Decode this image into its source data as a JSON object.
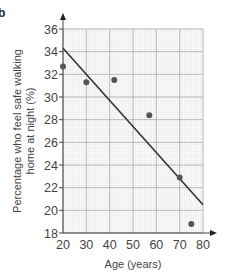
{
  "part_label": "b",
  "chart_data": {
    "type": "scatter",
    "title": "",
    "xlabel": "Age (years)",
    "ylabel_line1": "Percentage who feel safe walking",
    "ylabel_line2": "home at night (%)",
    "xlim": [
      20,
      80
    ],
    "ylim": [
      18,
      36
    ],
    "x_ticks": [
      20,
      30,
      40,
      50,
      60,
      70,
      80
    ],
    "y_ticks": [
      18,
      20,
      22,
      24,
      26,
      28,
      30,
      32,
      34,
      36
    ],
    "grid": true,
    "grid_major_x": 10,
    "grid_major_y": 2,
    "grid_minor_x": 1,
    "grid_minor_y": 0.2,
    "series": [
      {
        "name": "Data points",
        "kind": "scatter",
        "points": [
          {
            "x": 20,
            "y": 32.7
          },
          {
            "x": 30,
            "y": 31.3
          },
          {
            "x": 42,
            "y": 31.5
          },
          {
            "x": 57,
            "y": 28.4
          },
          {
            "x": 70,
            "y": 22.9
          },
          {
            "x": 75,
            "y": 18.8
          }
        ]
      },
      {
        "name": "Line of best fit",
        "kind": "line",
        "points": [
          {
            "x": 20,
            "y": 34.3
          },
          {
            "x": 80,
            "y": 20.5
          }
        ]
      }
    ],
    "colors": {
      "point": "#555555",
      "line": "#333333",
      "grid_major": "#a8a8a8",
      "grid_minor": "#e2e2e2",
      "axis": "#444444"
    }
  }
}
